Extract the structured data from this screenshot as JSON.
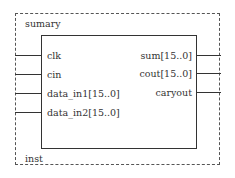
{
  "block": {
    "name": "sumary",
    "instance": "inst"
  },
  "inputs": [
    {
      "label": "clk",
      "y": 56
    },
    {
      "label": "cin",
      "y": 75
    },
    {
      "label": "data_in1[15..0]",
      "y": 94
    },
    {
      "label": "data_in2[15..0]",
      "y": 113
    }
  ],
  "outputs": [
    {
      "label": "sum[15..0]",
      "y": 56
    },
    {
      "label": "cout[15..0]",
      "y": 74
    },
    {
      "label": "caryout",
      "y": 93
    }
  ],
  "colors": {
    "line": "#333333",
    "dashed_border": "#555555",
    "background": "#ffffff"
  }
}
